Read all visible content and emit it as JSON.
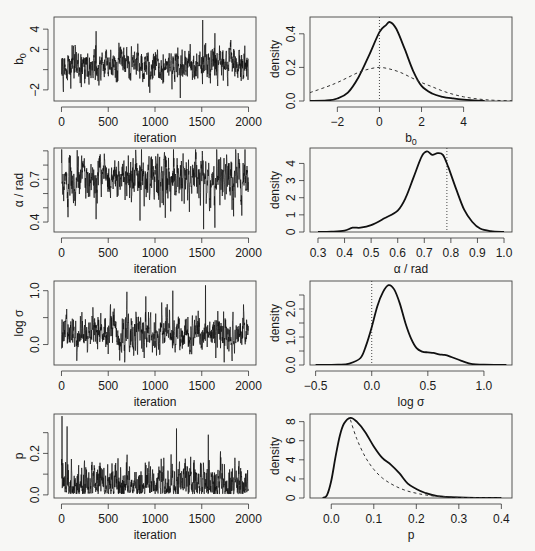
{
  "figure": {
    "width": 535,
    "height": 551,
    "colors": {
      "line": "#111111",
      "background": "#f7f7f5",
      "box": "#444444"
    }
  },
  "chart_data": [
    {
      "id": "trace_b0",
      "type": "line",
      "panel": "left",
      "row": 0,
      "title": "",
      "xlabel": "iteration",
      "ylabel": "b_0",
      "ylabel_sub": "0",
      "ylabel_base": "b",
      "xlim": [
        -80,
        2080
      ],
      "ylim": [
        -3.1,
        5.2
      ],
      "xticks": [
        0,
        500,
        1000,
        1500,
        2000
      ],
      "xtick_labels": [
        "0",
        "500",
        "1000",
        "1500",
        "2000"
      ],
      "yticks": [
        -2,
        0,
        2,
        4
      ],
      "ytick_labels": [
        "-2",
        "",
        "2",
        "4"
      ],
      "trace_summary": {
        "n": 2000,
        "mean": 0.5,
        "sd": 0.9,
        "min": -2.8,
        "max": 4.9,
        "spikes": [
          [
            1510,
            4.9
          ],
          [
            1640,
            3.6
          ],
          [
            370,
            3.8
          ],
          [
            1270,
            -2.8
          ]
        ]
      }
    },
    {
      "id": "density_b0",
      "type": "line",
      "panel": "right",
      "row": 0,
      "xlabel": "b_0",
      "xlabel_base": "b",
      "xlabel_sub": "0",
      "ylabel": "density",
      "xlim": [
        -3.3,
        6.3
      ],
      "ylim": [
        0,
        0.5
      ],
      "xticks": [
        -2,
        0,
        2,
        4
      ],
      "xtick_labels": [
        "-2",
        "0",
        "2",
        "4"
      ],
      "yticks": [
        0.0,
        0.2,
        0.4
      ],
      "ytick_labels": [
        "0.0",
        "0.2",
        "0.4"
      ],
      "refline_x": 0,
      "series": [
        {
          "name": "posterior",
          "style": "solid",
          "x": [
            -3.3,
            -2.5,
            -2.0,
            -1.5,
            -1.0,
            -0.5,
            0.0,
            0.3,
            0.5,
            0.8,
            1.2,
            1.6,
            2.0,
            2.5,
            3.0,
            3.5,
            4.0,
            4.5,
            5.0
          ],
          "y": [
            0.0,
            0.003,
            0.015,
            0.05,
            0.14,
            0.27,
            0.41,
            0.45,
            0.47,
            0.43,
            0.31,
            0.18,
            0.09,
            0.045,
            0.025,
            0.015,
            0.008,
            0.004,
            0.0
          ]
        },
        {
          "name": "prior",
          "style": "dashed",
          "x": [
            -3.3,
            -2.5,
            -2.0,
            -1.5,
            -1.0,
            -0.5,
            0.0,
            0.5,
            1.0,
            1.5,
            2.0,
            2.5,
            3.0,
            3.5,
            4.0,
            4.5,
            5.0,
            5.5,
            6.3
          ],
          "y": [
            0.05,
            0.085,
            0.11,
            0.14,
            0.17,
            0.19,
            0.2,
            0.19,
            0.17,
            0.14,
            0.11,
            0.085,
            0.06,
            0.04,
            0.025,
            0.015,
            0.008,
            0.004,
            0.001
          ]
        }
      ]
    },
    {
      "id": "trace_alpha",
      "type": "line",
      "panel": "left",
      "row": 1,
      "xlabel": "iteration",
      "ylabel": "α / rad",
      "xlim": [
        -80,
        2080
      ],
      "ylim": [
        0.33,
        0.92
      ],
      "xticks": [
        0,
        500,
        1000,
        1500,
        2000
      ],
      "xtick_labels": [
        "0",
        "500",
        "1000",
        "1500",
        "2000"
      ],
      "yticks": [
        0.4,
        0.5,
        0.6,
        0.7,
        0.8,
        0.9
      ],
      "ytick_labels": [
        "0.4",
        "",
        "",
        "0.7",
        "",
        ""
      ],
      "trace_summary": {
        "n": 2000,
        "mean": 0.71,
        "sd": 0.08,
        "min": 0.35,
        "max": 0.91,
        "dips": [
          [
            370,
            0.42
          ],
          [
            840,
            0.41
          ],
          [
            1110,
            0.43
          ],
          [
            1520,
            0.35
          ],
          [
            1640,
            0.36
          ],
          [
            1840,
            0.44
          ]
        ]
      }
    },
    {
      "id": "density_alpha",
      "type": "line",
      "panel": "right",
      "row": 1,
      "xlabel": "α / rad",
      "ylabel": "density",
      "xlim": [
        0.27,
        1.03
      ],
      "ylim": [
        0,
        4.9
      ],
      "xticks": [
        0.3,
        0.4,
        0.5,
        0.6,
        0.7,
        0.8,
        0.9,
        1.0
      ],
      "xtick_labels": [
        "0.3",
        "0.4",
        "0.5",
        "0.6",
        "0.7",
        "0.8",
        "0.9",
        "1.0"
      ],
      "yticks": [
        0,
        1,
        2,
        3,
        4
      ],
      "ytick_labels": [
        "0",
        "1",
        "2",
        "3",
        "4"
      ],
      "refline_x": 0.785,
      "series": [
        {
          "name": "posterior",
          "style": "solid",
          "x": [
            0.3,
            0.35,
            0.4,
            0.43,
            0.46,
            0.5,
            0.55,
            0.6,
            0.63,
            0.66,
            0.69,
            0.71,
            0.73,
            0.75,
            0.77,
            0.79,
            0.82,
            0.85,
            0.88,
            0.91,
            0.95,
            1.0
          ],
          "y": [
            0.0,
            0.02,
            0.08,
            0.25,
            0.25,
            0.4,
            0.8,
            1.25,
            2.0,
            3.2,
            4.4,
            4.7,
            4.5,
            4.6,
            4.5,
            3.8,
            2.5,
            1.3,
            0.6,
            0.2,
            0.05,
            0.0
          ]
        }
      ]
    },
    {
      "id": "trace_logsigma",
      "type": "line",
      "panel": "left",
      "row": 2,
      "xlabel": "iteration",
      "ylabel": "log σ",
      "xlim": [
        -80,
        2080
      ],
      "ylim": [
        -0.38,
        1.18
      ],
      "xticks": [
        0,
        500,
        1000,
        1500,
        2000
      ],
      "xtick_labels": [
        "0",
        "500",
        "1000",
        "1500",
        "2000"
      ],
      "yticks": [
        0.0,
        0.5,
        1.0
      ],
      "ytick_labels": [
        "0.0",
        "",
        "1.0"
      ],
      "trace_summary": {
        "n": 2000,
        "mean": 0.2,
        "sd": 0.18,
        "min": -0.33,
        "max": 1.1,
        "spikes": [
          [
            700,
            0.98
          ],
          [
            1190,
            1.0
          ],
          [
            1540,
            1.1
          ],
          [
            1740,
            -0.33
          ]
        ]
      }
    },
    {
      "id": "density_logsigma",
      "type": "line",
      "panel": "right",
      "row": 2,
      "xlabel": "log σ",
      "ylabel": "density",
      "xlim": [
        -0.55,
        1.25
      ],
      "ylim": [
        0,
        3.0
      ],
      "xticks": [
        -0.5,
        0.0,
        0.5,
        1.0
      ],
      "xtick_labels": [
        "-0.5",
        "0.0",
        "0.5",
        "1.0"
      ],
      "yticks": [
        0.0,
        0.5,
        1.0,
        1.5,
        2.0,
        2.5
      ],
      "ytick_labels": [
        "0.0",
        "",
        "1.0",
        "",
        "2.0",
        ""
      ],
      "refline_x": 0,
      "series": [
        {
          "name": "posterior",
          "style": "solid",
          "x": [
            -0.5,
            -0.3,
            -0.2,
            -0.1,
            -0.05,
            0.0,
            0.05,
            0.1,
            0.15,
            0.2,
            0.25,
            0.3,
            0.35,
            0.4,
            0.45,
            0.5,
            0.55,
            0.6,
            0.65,
            0.7,
            0.8,
            0.9,
            1.0,
            1.2
          ],
          "y": [
            0.0,
            0.01,
            0.05,
            0.25,
            0.7,
            1.35,
            2.1,
            2.6,
            2.85,
            2.7,
            2.2,
            1.5,
            0.95,
            0.6,
            0.48,
            0.45,
            0.43,
            0.38,
            0.36,
            0.3,
            0.15,
            0.03,
            0.01,
            0.0
          ]
        }
      ]
    },
    {
      "id": "trace_p",
      "type": "line",
      "panel": "left",
      "row": 3,
      "xlabel": "iteration",
      "ylabel": "p",
      "xlim": [
        -80,
        2080
      ],
      "ylim": [
        -0.015,
        0.39
      ],
      "xticks": [
        0,
        500,
        1000,
        1500,
        2000
      ],
      "xtick_labels": [
        "0",
        "500",
        "1000",
        "1500",
        "2000"
      ],
      "yticks": [
        0.0,
        0.1,
        0.2,
        0.3
      ],
      "ytick_labels": [
        "0.0",
        "",
        "0.2",
        ""
      ],
      "trace_summary": {
        "n": 2000,
        "mean": 0.08,
        "sd": 0.05,
        "min": 0.005,
        "max": 0.38,
        "spikes": [
          [
            5,
            0.38
          ],
          [
            60,
            0.33
          ],
          [
            1230,
            0.32
          ],
          [
            1570,
            0.29
          ]
        ]
      }
    },
    {
      "id": "density_p",
      "type": "line",
      "panel": "right",
      "row": 3,
      "xlabel": "p",
      "ylabel": "density",
      "xlim": [
        -0.05,
        0.425
      ],
      "ylim": [
        0,
        8.8
      ],
      "xticks": [
        0.0,
        0.1,
        0.2,
        0.3,
        0.4
      ],
      "xtick_labels": [
        "0.0",
        "0.1",
        "0.2",
        "0.3",
        "0.4"
      ],
      "yticks": [
        0,
        2,
        4,
        6,
        8
      ],
      "ytick_labels": [
        "0",
        "2",
        "4",
        "6",
        "8"
      ],
      "refline_x": null,
      "series": [
        {
          "name": "posterior",
          "style": "solid",
          "x": [
            -0.02,
            -0.01,
            0.0,
            0.01,
            0.02,
            0.03,
            0.045,
            0.06,
            0.08,
            0.1,
            0.12,
            0.14,
            0.16,
            0.18,
            0.2,
            0.22,
            0.25,
            0.3,
            0.35,
            0.4
          ],
          "y": [
            0.0,
            0.3,
            1.8,
            4.3,
            6.5,
            7.8,
            8.4,
            8.0,
            6.9,
            5.4,
            4.2,
            3.5,
            2.6,
            1.5,
            0.95,
            0.55,
            0.2,
            0.05,
            0.01,
            0.0
          ]
        },
        {
          "name": "prior",
          "style": "dashed",
          "x": [
            0.045,
            0.06,
            0.08,
            0.1,
            0.12,
            0.14,
            0.16,
            0.18,
            0.2,
            0.22,
            0.25,
            0.3,
            0.35,
            0.4
          ],
          "y": [
            8.2,
            6.2,
            4.3,
            3.0,
            2.1,
            1.5,
            1.05,
            0.72,
            0.5,
            0.33,
            0.18,
            0.06,
            0.02,
            0.005
          ]
        }
      ]
    }
  ]
}
